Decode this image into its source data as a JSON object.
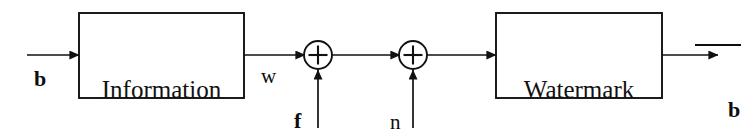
{
  "diagram": {
    "background_color": "#ffffff",
    "stroke_color": "#111111",
    "blocks": [
      {
        "id": "information-coding",
        "line1": "Information",
        "line2": "Coding",
        "x": 79,
        "y": 13,
        "w": 165,
        "h": 85
      },
      {
        "id": "watermark-decoding",
        "line1": "Watermark",
        "line2": "decoding",
        "x": 496,
        "y": 13,
        "w": 166,
        "h": 85
      }
    ],
    "adders": [
      {
        "id": "adder-1",
        "symbol": "+",
        "cx": 318,
        "cy": 55,
        "r": 14
      },
      {
        "id": "adder-2",
        "symbol": "+",
        "cx": 413,
        "cy": 55,
        "r": 14
      }
    ],
    "signals": [
      {
        "id": "input-b",
        "label": "b",
        "bold": true,
        "overbar": false,
        "x": 34,
        "y": 66
      },
      {
        "id": "watermark-w",
        "label": "w",
        "bold": false,
        "overbar": false,
        "x": 261,
        "y": 64
      },
      {
        "id": "host-f",
        "label": "f",
        "bold": true,
        "overbar": false,
        "x": 294,
        "y": 108
      },
      {
        "id": "noise-n",
        "label": "n",
        "bold": false,
        "overbar": false,
        "x": 390,
        "y": 110
      },
      {
        "id": "output-b-hat",
        "label": "b",
        "bold": true,
        "overbar": true,
        "x": 673,
        "y": 17
      }
    ]
  }
}
